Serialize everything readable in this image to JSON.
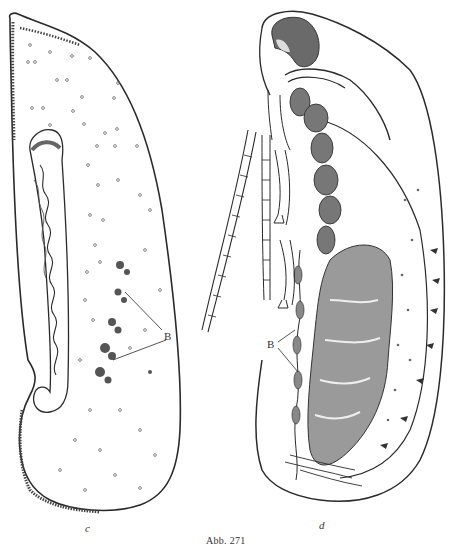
{
  "plate": {
    "caption": "Abb. 271",
    "figures": [
      {
        "id": "c",
        "label": "c",
        "annotations": [
          {
            "label": "B"
          }
        ]
      },
      {
        "id": "d",
        "label": "d",
        "annotations": [
          {
            "label": "B"
          }
        ]
      }
    ],
    "colors": {
      "ink": "#2a2a2a",
      "paper": "#ffffff",
      "stipple": "#555555"
    }
  }
}
